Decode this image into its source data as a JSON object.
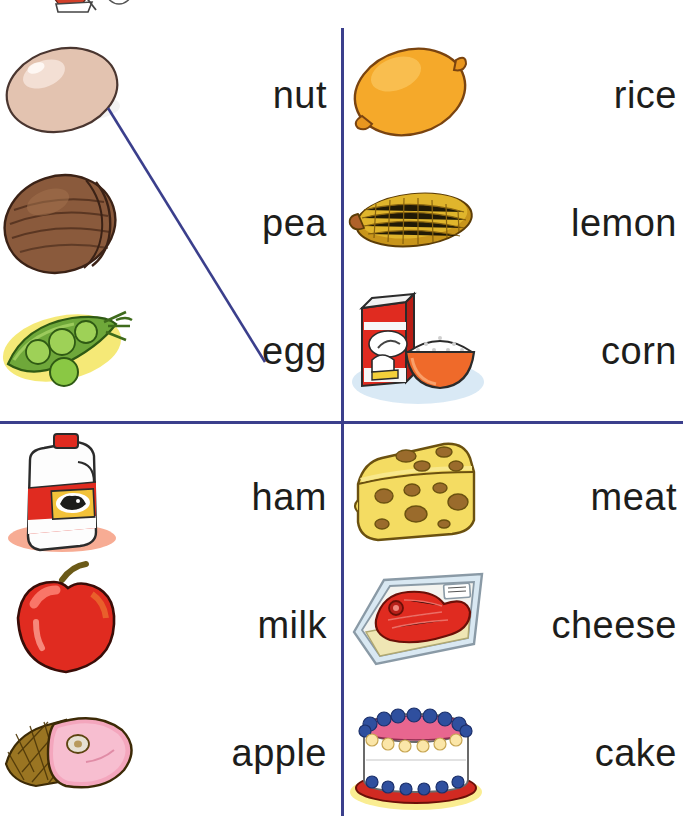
{
  "worksheet": {
    "type": "matching-worksheet",
    "line_color": "#3b3f8c",
    "text_color": "#1d1d1b",
    "background": "#ffffff",
    "quadrants": [
      {
        "id": "top-left",
        "rows": [
          {
            "image": "egg-picture",
            "word": "nut"
          },
          {
            "image": "nut-picture",
            "word": "pea"
          },
          {
            "image": "pea-picture",
            "word": "egg"
          }
        ]
      },
      {
        "id": "top-right",
        "rows": [
          {
            "image": "lemon-picture",
            "word": "rice"
          },
          {
            "image": "corn-picture",
            "word": "lemon"
          },
          {
            "image": "rice-picture",
            "word": "corn"
          }
        ]
      },
      {
        "id": "bottom-left",
        "rows": [
          {
            "image": "milk-picture",
            "word": "ham"
          },
          {
            "image": "apple-picture",
            "word": "milk"
          },
          {
            "image": "ham-picture",
            "word": "apple"
          }
        ]
      },
      {
        "id": "bottom-right",
        "rows": [
          {
            "image": "cheese-picture",
            "word": "meat"
          },
          {
            "image": "meat-picture",
            "word": "cheese"
          },
          {
            "image": "cake-picture",
            "word": "cake"
          }
        ]
      }
    ],
    "drawn_answers": [
      {
        "from": "egg-picture",
        "to": "egg-word",
        "color": "#3b3f8c"
      }
    ]
  }
}
